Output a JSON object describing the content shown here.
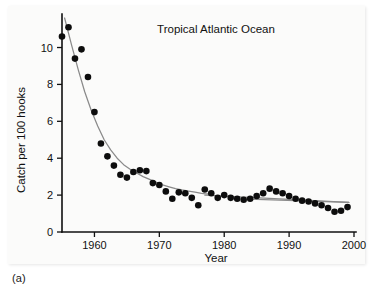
{
  "figure": {
    "panel_label": "(a)",
    "background_color": "#fbfbfa",
    "point_color": "#0d0d0d",
    "fit_color": "#8a8a8a",
    "axis_color": "#101010"
  },
  "chart_data": {
    "type": "scatter",
    "title": "Tropical Atlantic Ocean",
    "xlabel": "Year",
    "ylabel": "Catch per 100 hooks",
    "xlim": [
      1955,
      2000
    ],
    "ylim": [
      0,
      11.6
    ],
    "xticks": [
      1960,
      1970,
      1980,
      1990,
      2000
    ],
    "xticklabels": [
      "1960",
      "1970",
      "1980",
      "1990",
      "2000"
    ],
    "yticks": [
      0,
      2,
      4,
      6,
      8,
      10
    ],
    "yticklabels": [
      "0",
      "2",
      "4",
      "6",
      "8",
      "10"
    ],
    "grid": false,
    "legend": "none",
    "series": [
      {
        "name": "Catch per 100 hooks",
        "marker": "filled-circle",
        "x": [
          1955,
          1956,
          1957,
          1958,
          1959,
          1960,
          1961,
          1962,
          1963,
          1964,
          1965,
          1966,
          1967,
          1968,
          1969,
          1970,
          1971,
          1972,
          1973,
          1974,
          1975,
          1976,
          1977,
          1978,
          1979,
          1980,
          1981,
          1982,
          1983,
          1984,
          1985,
          1986,
          1987,
          1988,
          1989,
          1990,
          1991,
          1992,
          1993,
          1994,
          1995,
          1996,
          1997,
          1998,
          1999
        ],
        "y": [
          10.6,
          11.1,
          9.4,
          9.9,
          8.4,
          6.5,
          4.8,
          4.1,
          3.6,
          3.1,
          2.95,
          3.25,
          3.35,
          3.3,
          2.65,
          2.55,
          2.2,
          1.8,
          2.15,
          2.1,
          1.85,
          1.45,
          2.3,
          2.1,
          1.85,
          2.0,
          1.85,
          1.8,
          1.75,
          1.8,
          1.95,
          2.1,
          2.35,
          2.2,
          2.1,
          1.95,
          1.8,
          1.7,
          1.65,
          1.55,
          1.45,
          1.3,
          1.1,
          1.15,
          1.35
        ]
      }
    ],
    "fits": [
      {
        "name": "exponential-decline-fit",
        "segment": "1955-1977",
        "x": [
          1955.4,
          1956.5,
          1957.5,
          1958.5,
          1959.5,
          1960.5,
          1961.5,
          1962.5,
          1963.5,
          1964.5,
          1965.5,
          1966.5,
          1967.5,
          1968.5,
          1969.5,
          1970.5,
          1971.5,
          1972.5,
          1973.5,
          1974.5,
          1975.5,
          1976.5,
          1977.5
        ],
        "y": [
          11.6,
          10.1,
          8.8,
          7.6,
          6.6,
          5.75,
          5.0,
          4.45,
          4.0,
          3.65,
          3.4,
          3.2,
          3.0,
          2.85,
          2.7,
          2.55,
          2.45,
          2.35,
          2.28,
          2.22,
          2.16,
          2.1,
          2.05
        ]
      },
      {
        "name": "flat-trend-fit",
        "segment": "1977-1999",
        "x": [
          1977.0,
          1999.2
        ],
        "y": [
          2.0,
          1.6
        ]
      },
      {
        "name": "flat-trend-fit-late",
        "segment": "1984-1999",
        "x": [
          1983.8,
          1999.2
        ],
        "y": [
          1.78,
          1.6
        ]
      }
    ]
  }
}
